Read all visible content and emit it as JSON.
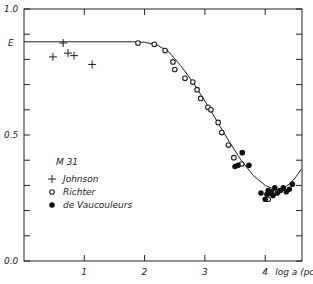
{
  "chart_data": {
    "type": "scatter",
    "title": "",
    "xlabel": "log a (pc)",
    "ylabel": "",
    "xlim": [
      0,
      4.6
    ],
    "ylim": [
      0,
      1.0
    ],
    "x_ticks": [
      1,
      2,
      3,
      4
    ],
    "x_tick_labels": [
      "1",
      "2",
      "3",
      "4"
    ],
    "y_ticks": [
      0.0,
      0.1,
      0.2,
      0.3,
      0.4,
      0.5,
      0.6,
      0.7,
      0.8,
      0.9,
      1.0
    ],
    "y_tick_labels": {
      "0.0": "0.0",
      "0.5": "0.5",
      "1.0": "1.0"
    },
    "y_reference": {
      "label": "E",
      "value": 0.87
    },
    "grid": false,
    "legend": {
      "title": "M 31",
      "position": "lower-left",
      "entries": [
        {
          "label": "Johnson",
          "marker": "plus"
        },
        {
          "label": "Richter",
          "marker": "open-circle"
        },
        {
          "label": "de Vaucouleurs",
          "marker": "filled-circle"
        }
      ]
    },
    "series": [
      {
        "name": "Johnson",
        "marker": "plus",
        "points": [
          [
            0.48,
            0.81
          ],
          [
            0.65,
            0.865
          ],
          [
            0.73,
            0.825
          ],
          [
            0.83,
            0.815
          ],
          [
            1.13,
            0.78
          ]
        ]
      },
      {
        "name": "Richter",
        "marker": "open-circle",
        "points": [
          [
            1.89,
            0.865
          ],
          [
            2.16,
            0.86
          ],
          [
            2.34,
            0.835
          ],
          [
            2.47,
            0.79
          ],
          [
            2.5,
            0.76
          ],
          [
            2.67,
            0.725
          ],
          [
            2.8,
            0.71
          ],
          [
            2.87,
            0.68
          ],
          [
            2.93,
            0.645
          ],
          [
            3.05,
            0.61
          ],
          [
            3.1,
            0.6
          ],
          [
            3.22,
            0.55
          ],
          [
            3.28,
            0.51
          ],
          [
            3.39,
            0.46
          ],
          [
            3.48,
            0.41
          ],
          [
            3.61,
            0.385
          ],
          [
            4.05,
            0.245
          ]
        ]
      },
      {
        "name": "de Vaucouleurs",
        "marker": "filled-circle",
        "points": [
          [
            3.62,
            0.43
          ],
          [
            3.5,
            0.375
          ],
          [
            3.55,
            0.38
          ],
          [
            3.73,
            0.38
          ],
          [
            3.93,
            0.27
          ],
          [
            4.0,
            0.245
          ],
          [
            4.05,
            0.28
          ],
          [
            4.08,
            0.27
          ],
          [
            4.13,
            0.26
          ],
          [
            4.16,
            0.29
          ],
          [
            4.2,
            0.27
          ],
          [
            4.25,
            0.28
          ],
          [
            4.3,
            0.29
          ],
          [
            4.35,
            0.275
          ],
          [
            4.4,
            0.285
          ],
          [
            4.45,
            0.305
          ],
          [
            4.1,
            0.275
          ],
          [
            4.03,
            0.265
          ]
        ]
      }
    ],
    "fit_curve": {
      "name": "model",
      "points": [
        [
          0.0,
          0.87
        ],
        [
          1.8,
          0.87
        ],
        [
          2.0,
          0.868
        ],
        [
          2.2,
          0.858
        ],
        [
          2.4,
          0.83
        ],
        [
          2.6,
          0.775
        ],
        [
          2.8,
          0.71
        ],
        [
          3.0,
          0.635
        ],
        [
          3.2,
          0.555
        ],
        [
          3.4,
          0.475
        ],
        [
          3.6,
          0.4
        ],
        [
          3.8,
          0.34
        ],
        [
          4.0,
          0.3
        ],
        [
          4.1,
          0.29
        ],
        [
          4.2,
          0.285
        ],
        [
          4.3,
          0.29
        ],
        [
          4.4,
          0.305
        ],
        [
          4.5,
          0.33
        ],
        [
          4.6,
          0.365
        ]
      ]
    }
  }
}
